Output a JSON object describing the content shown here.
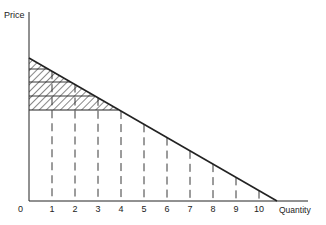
{
  "chart_data": {
    "type": "line",
    "title": "",
    "xlabel": "Quantity",
    "ylabel": "Price",
    "origin_label": "0",
    "x_ticks": [
      "1",
      "2",
      "3",
      "4",
      "5",
      "6",
      "7",
      "8",
      "9",
      "10"
    ],
    "xlim": [
      0,
      12.2
    ],
    "grid": false,
    "legend": "none",
    "series": [
      {
        "name": "Demand curve",
        "x": [
          0,
          10.7
        ],
        "y": [
          10.7,
          0
        ],
        "style": "solid",
        "color": "#222222"
      }
    ],
    "vertical_dashed_lines_at": [
      1,
      2,
      3,
      4,
      5,
      6,
      7,
      8,
      9,
      10
    ],
    "shaded_region": {
      "description": "Hatched area between demand curve and price line up to quantity 4 (consumer surplus)",
      "x_range": [
        0,
        4
      ],
      "price_floor": 6.7,
      "step_price_levels": [
        9.7,
        8.7,
        7.7,
        6.7
      ],
      "pattern": "diagonal hatch"
    }
  }
}
